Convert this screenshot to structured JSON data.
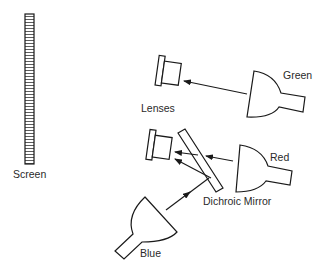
{
  "diagram": {
    "colors": {
      "stroke": "#1a1a1a",
      "text": "#2a2a2a",
      "background": "#ffffff"
    },
    "labels": {
      "screen": "Screen",
      "lenses": "Lenses",
      "green": "Green",
      "red": "Red",
      "blue": "Blue",
      "dichroic_mirror": "Dichroic Mirror"
    },
    "components": [
      {
        "id": "screen",
        "type": "projection-screen"
      },
      {
        "id": "lens-upper",
        "type": "lens"
      },
      {
        "id": "lens-lower",
        "type": "lens"
      },
      {
        "id": "lamp-green",
        "type": "lamp",
        "color": "Green"
      },
      {
        "id": "lamp-red",
        "type": "lamp",
        "color": "Red"
      },
      {
        "id": "lamp-blue",
        "type": "lamp",
        "color": "Blue"
      },
      {
        "id": "dichroic-mirror",
        "type": "mirror"
      }
    ],
    "edges": [
      {
        "from": "lamp-green",
        "to": "lens-upper"
      },
      {
        "from": "lamp-red",
        "to": "lens-lower",
        "via": "dichroic-mirror"
      },
      {
        "from": "lamp-blue",
        "to": "lens-lower",
        "via": "dichroic-mirror"
      }
    ]
  }
}
